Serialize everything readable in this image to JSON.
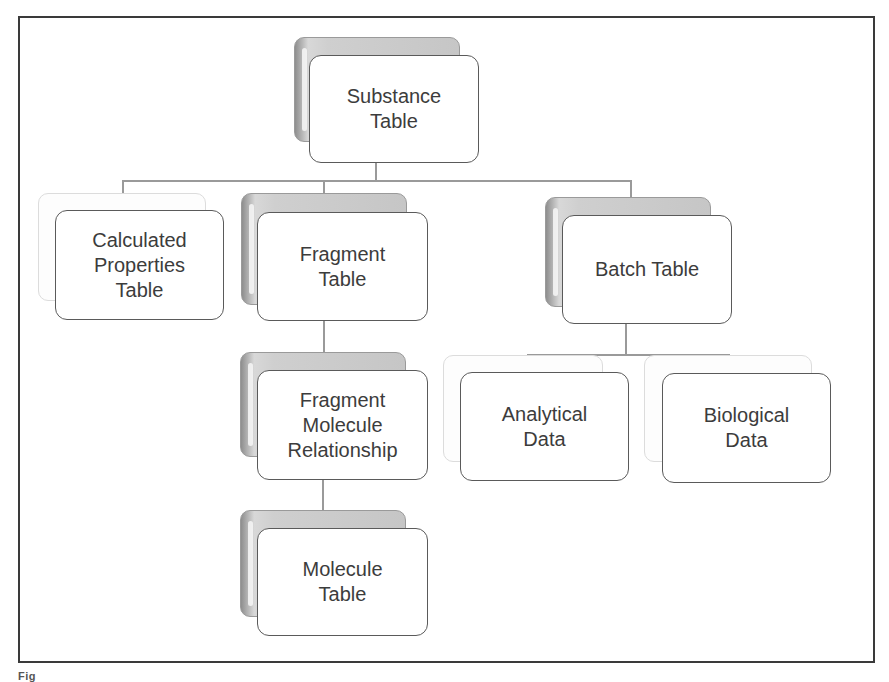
{
  "diagram": {
    "type": "hierarchy",
    "nodes": {
      "substance": "Substance\nTable",
      "calculated": "Calculated\nProperties\nTable",
      "fragment": "Fragment\nTable",
      "batch": "Batch Table",
      "fmr": "Fragment\nMolecule\nRelationship",
      "molecule": "Molecule\nTable",
      "analytical": "Analytical\nData",
      "biological": "Biological\nData"
    },
    "edges": [
      [
        "Substance Table",
        "Calculated Properties Table"
      ],
      [
        "Substance Table",
        "Fragment Table"
      ],
      [
        "Substance Table",
        "Batch Table"
      ],
      [
        "Fragment Table",
        "Fragment Molecule Relationship"
      ],
      [
        "Fragment Molecule Relationship",
        "Molecule Table"
      ],
      [
        "Batch Table",
        "Analytical Data"
      ],
      [
        "Batch Table",
        "Biological Data"
      ]
    ],
    "colors": {
      "border": "#5a5a5a",
      "shadow": "#c6c6c6",
      "connector": "#9a9a9a",
      "text": "#3c3c3c"
    }
  },
  "caption": "Fig"
}
